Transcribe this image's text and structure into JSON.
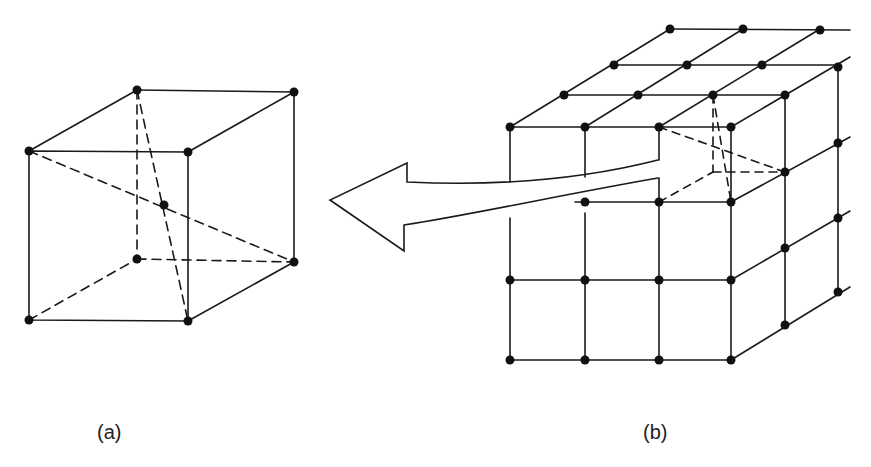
{
  "figure": {
    "panel_a": {
      "label": "(a)",
      "description": "Single hexahedral cell with 8 corner nodes and 1 center node (body-centered)"
    },
    "panel_b": {
      "label": "(b)",
      "description": "3D grid of cells; one corner cell highlighted and extracted via arrow to panel (a)"
    },
    "arrow": {
      "direction": "left",
      "from": "panel_b",
      "to": "panel_a"
    },
    "colors": {
      "line": "#1a1a1a",
      "node": "#111111",
      "background": "#ffffff"
    }
  }
}
